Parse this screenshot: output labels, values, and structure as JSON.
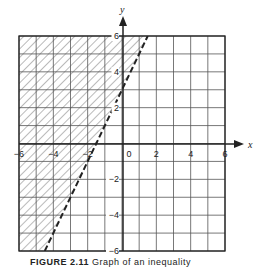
{
  "chart_data": {
    "type": "line",
    "title": "",
    "xlabel": "x",
    "ylabel": "y",
    "xlim": [
      -6,
      6
    ],
    "ylim": [
      -6,
      6
    ],
    "grid": true,
    "grid_step": 1,
    "x_ticks": [
      -6,
      -4,
      -2,
      0,
      2,
      4,
      6
    ],
    "y_ticks": [
      -6,
      -4,
      -2,
      2,
      4,
      6
    ],
    "x_tick_labels": [
      "-6",
      "-4",
      "-2",
      "0",
      "2",
      "4",
      "6"
    ],
    "y_tick_labels": [
      "6",
      "4",
      "2",
      "-2",
      "-4",
      "-6"
    ],
    "series": [
      {
        "name": "boundary line y = 2x + 3",
        "style": "dashed",
        "slope": 2,
        "intercept": 3,
        "points": [
          [
            -4.5,
            -6
          ],
          [
            -1.5,
            0
          ],
          [
            0,
            3
          ],
          [
            1.5,
            6
          ]
        ]
      }
    ],
    "shaded_region": {
      "description": "hatched region above/left of the dashed line (y > 2x + 3)",
      "inequality": "y > 2x + 3",
      "polygon": [
        [
          -6,
          -6
        ],
        [
          -4.5,
          -6
        ],
        [
          1.5,
          6
        ],
        [
          -6,
          6
        ]
      ],
      "fill": "diagonal hatch"
    },
    "legend": null
  },
  "figure": {
    "axis_x_label": "x",
    "axis_y_label": "y",
    "caption_bold": "FIGURE 2.11",
    "caption_rest": "Graph of an inequality"
  },
  "colors": {
    "line": "#222222",
    "grid": "#555555",
    "hatch": "#666666",
    "background": "#ffffff"
  }
}
